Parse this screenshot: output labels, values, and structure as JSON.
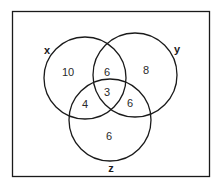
{
  "diagram": {
    "type": "venn-3",
    "sets": [
      {
        "name": "x",
        "label": "x"
      },
      {
        "name": "y",
        "label": "y"
      },
      {
        "name": "z",
        "label": "z"
      }
    ],
    "regions": {
      "x_only": "10",
      "y_only": "8",
      "z_only": "6",
      "x_and_y_only": "6",
      "x_and_z_only": "4",
      "y_and_z_only": "6",
      "x_y_z": "3"
    },
    "colors": {
      "stroke": "#1a1a1a",
      "background": "#ffffff"
    }
  }
}
